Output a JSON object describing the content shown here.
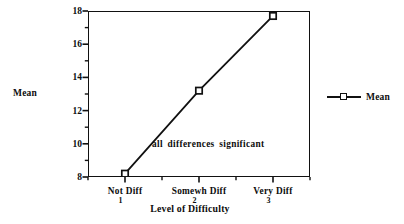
{
  "chart_data": {
    "type": "line",
    "title": "",
    "xlabel": "Level of Difficulty",
    "ylabel": "Mean",
    "categories": [
      "Not Diff",
      "Somewh Diff",
      "Very Diff"
    ],
    "category_numbers": [
      "1",
      "2",
      "3"
    ],
    "x": [
      1,
      2,
      3
    ],
    "series": [
      {
        "name": "Mean",
        "values": [
          8.2,
          13.2,
          17.7
        ],
        "marker": "square",
        "color": "#111111"
      }
    ],
    "ylim": [
      8,
      18
    ],
    "xlim": [
      0.5,
      3.5
    ],
    "yticks": [
      8,
      10,
      12,
      14,
      16,
      18
    ],
    "ytick_labels": [
      "8",
      "10",
      "12",
      "14",
      "16",
      "18"
    ],
    "y_minor_ticks": [
      9,
      11,
      13,
      15,
      17
    ],
    "grid": false,
    "frame": "box",
    "legend_position": "right-outside",
    "annotations": [
      {
        "text": "all differences significant",
        "x": 1.9,
        "y": 9.6
      }
    ]
  },
  "legend": {
    "entries": [
      {
        "label": "Mean"
      }
    ]
  }
}
